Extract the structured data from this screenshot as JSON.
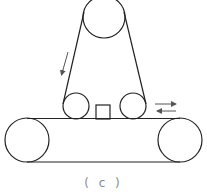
{
  "figure": {
    "caption": "( c )",
    "stroke_color": "#222222",
    "arrow_color": "#555555"
  },
  "components": {
    "top_pulley": {
      "cx": 104,
      "cy": 17,
      "r": 21
    },
    "left_roller": {
      "cx": 76,
      "cy": 106,
      "r": 13
    },
    "right_roller": {
      "cx": 133,
      "cy": 106,
      "r": 13
    },
    "workpiece": {
      "x": 96,
      "y": 105,
      "w": 14,
      "h": 14
    },
    "conveyor": {
      "top_y": 119,
      "bottom_y": 162,
      "left_pulley": {
        "cx": 27,
        "cy": 140,
        "r": 22
      },
      "right_pulley": {
        "cx": 180,
        "cy": 140,
        "r": 22
      }
    },
    "belt_left": {
      "x1": 84,
      "y1": 12,
      "x2": 63,
      "y2": 104
    },
    "belt_right": {
      "x1": 124,
      "y1": 12,
      "x2": 146,
      "y2": 104
    },
    "direction_arrow": {
      "x1": 68,
      "y1": 52,
      "x2": 61,
      "y2": 76,
      "label": "belt-direction"
    },
    "reciprocate_arrows": [
      {
        "x1": 155,
        "y1": 104,
        "x2": 176,
        "y2": 104,
        "direction": "right"
      },
      {
        "x1": 176,
        "y1": 111,
        "x2": 157,
        "y2": 111,
        "direction": "left"
      }
    ]
  }
}
